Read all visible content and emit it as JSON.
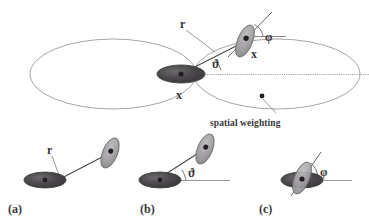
{
  "figure": {
    "background_color": "#ffffff",
    "ink_color": "#39383a",
    "outline_color": "#8d8b8e",
    "axis_color": "#9b999c",
    "cell_dark_fill": "#4a474b",
    "cell_light_fill": "#a3a0a4",
    "cell_edge": "#6b686c",
    "nucleus_fill": "#2b292c"
  },
  "main_panel": {
    "labels": {
      "r": "r",
      "theta": "ϑ",
      "phi": "φ",
      "x_center": "x",
      "x_neighbour": "x",
      "spatial_weighting": "spatial weighting"
    },
    "lobes": [
      {
        "name": "left-lobe",
        "cx": 113,
        "cy": 74,
        "rx": 83,
        "ry": 35
      },
      {
        "name": "right-lobe",
        "cx": 277,
        "cy": 74,
        "rx": 83,
        "ry": 35
      }
    ],
    "reference_axis": {
      "x1": 196,
      "y1": 74,
      "x2": 369,
      "y2": 74
    },
    "center_cell": {
      "cx": 181,
      "cy": 74,
      "rx": 24,
      "ry": 9,
      "angle": 0
    },
    "neighbour_cell": {
      "cx": 245,
      "cy": 41,
      "rx": 7,
      "ry": 17,
      "angle": 22
    },
    "weighting_dot": {
      "cx": 262,
      "cy": 96
    }
  },
  "sub_panels": [
    {
      "id": "a",
      "label": "(a)",
      "shows": "r",
      "annotation": "r"
    },
    {
      "id": "b",
      "label": "(b)",
      "shows": "ϑ",
      "annotation": "ϑ"
    },
    {
      "id": "c",
      "label": "(c)",
      "shows": "φ",
      "annotation": "φ"
    }
  ]
}
